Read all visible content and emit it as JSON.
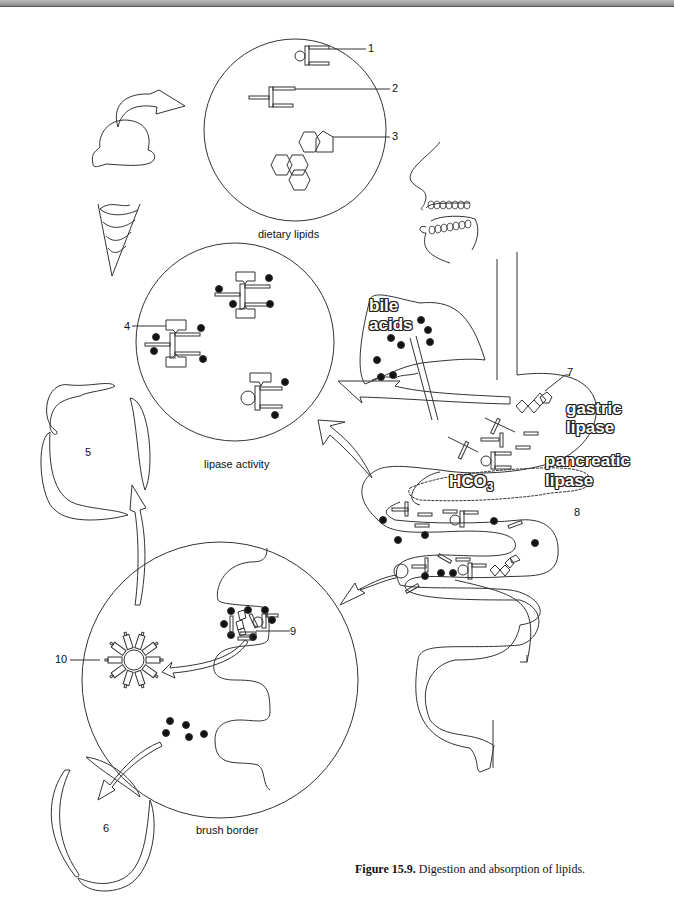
{
  "figure": {
    "caption_label": "Figure 15.9.",
    "caption_text": " Digestion and absorption of lipids."
  },
  "panels": {
    "dietary": {
      "title": "dietary lipids"
    },
    "lipase": {
      "title": "lipase activity"
    },
    "brush": {
      "title": "brush border"
    }
  },
  "callouts": [
    "1",
    "2",
    "3",
    "4",
    "5",
    "6",
    "7",
    "8",
    "9",
    "10"
  ],
  "organ_labels": {
    "bile_line1": "bile",
    "bile_line2": "acids",
    "gastric_line1": "gastric",
    "gastric_line2": "lipase",
    "pancreatic_line1": "pancreatic",
    "pancreatic_line2": "lipase",
    "hco3": "HCO",
    "hco3_sub": "3",
    "hco3_sup": "-"
  },
  "icons": [
    "ice-cream-icon",
    "curved-arrow-icon",
    "face-profile-icon",
    "triglyceride-icon",
    "phospholipid-icon",
    "cholesterol-icon",
    "micelle-icon",
    "stomach-icon",
    "liver-icon",
    "intestine-icon",
    "pancreas-icon"
  ]
}
